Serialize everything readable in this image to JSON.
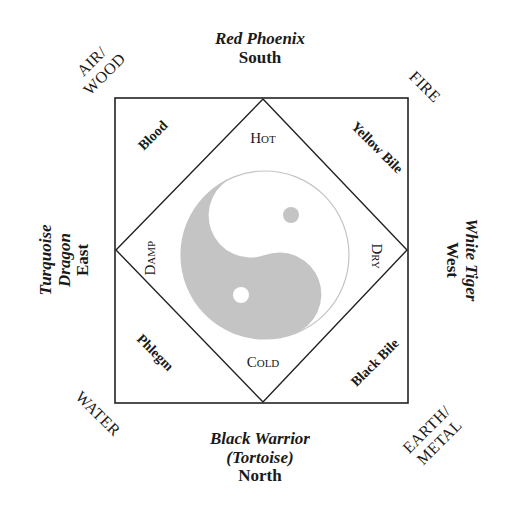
{
  "directions": {
    "south": {
      "animal": "Red Phoenix",
      "direction": "South"
    },
    "east": {
      "animal_line1": "Turquoise",
      "animal_line2": "Dragon",
      "direction": "East"
    },
    "west": {
      "animal": "White Tiger",
      "direction": "West"
    },
    "north": {
      "animal": "Black Warrior",
      "animal_alt": "(Tortoise)",
      "direction": "North"
    }
  },
  "elements": {
    "top_left": {
      "line1": "AIR/",
      "line2": "WOOD"
    },
    "top_right": {
      "line1": "FIRE"
    },
    "bottom_left": {
      "line1": "WATER"
    },
    "bottom_right": {
      "line1": "EARTH/",
      "line2": "METAL"
    }
  },
  "humors": {
    "top_left": "Blood",
    "top_right": "Yellow Bile",
    "bottom_left": "Phlegm",
    "bottom_right": "Black Bile"
  },
  "qualities": {
    "top": "Hot",
    "right": "Dry",
    "bottom": "Cold",
    "left": "Damp"
  },
  "colors": {
    "line": "#222222",
    "yin": "#c4c4c4",
    "yang": "#ffffff"
  }
}
